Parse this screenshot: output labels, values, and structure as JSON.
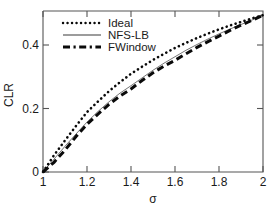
{
  "figure": {
    "background_color": "#ffffff",
    "ink_color": "#0a0a0a",
    "axis_color": "#555555"
  },
  "axes": {
    "x_label": "σ",
    "y_label": "CLR",
    "x_ticks": [
      "1",
      "1.2",
      "1.4",
      "1.6",
      "1.8",
      "2"
    ],
    "y_ticks": [
      "0",
      "0.2",
      "0.4"
    ]
  },
  "legend": {
    "entries": [
      {
        "label": "Ideal",
        "style": "dotted",
        "color": "#0a0a0a"
      },
      {
        "label": "NFS-LB",
        "style": "solid",
        "color": "#3a3a3a"
      },
      {
        "label": "FWindow",
        "style": "dash-dot",
        "color": "#0a0a0a"
      }
    ]
  },
  "chart_data": {
    "type": "line",
    "title": "",
    "xlabel": "σ",
    "ylabel": "CLR",
    "xlim": [
      1,
      2
    ],
    "ylim": [
      0,
      0.5
    ],
    "xticks": [
      1,
      1.2,
      1.4,
      1.6,
      1.8,
      2
    ],
    "yticks": [
      0,
      0.2,
      0.4
    ],
    "grid": false,
    "legend_position": "upper-left-inside",
    "x": [
      1.0,
      1.05,
      1.1,
      1.15,
      1.2,
      1.25,
      1.3,
      1.35,
      1.4,
      1.45,
      1.5,
      1.55,
      1.6,
      1.65,
      1.7,
      1.75,
      1.8,
      1.85,
      1.9,
      1.95,
      2.0
    ],
    "series": [
      {
        "name": "Ideal",
        "style": "dotted",
        "values": [
          0.0,
          0.052,
          0.098,
          0.143,
          0.186,
          0.219,
          0.251,
          0.279,
          0.305,
          0.327,
          0.348,
          0.367,
          0.385,
          0.401,
          0.416,
          0.43,
          0.443,
          0.455,
          0.466,
          0.477,
          0.487
        ]
      },
      {
        "name": "NFS-LB",
        "style": "solid",
        "values": [
          0.0,
          0.04,
          0.08,
          0.118,
          0.155,
          0.188,
          0.218,
          0.245,
          0.268,
          0.292,
          0.316,
          0.338,
          0.358,
          0.378,
          0.396,
          0.413,
          0.429,
          0.444,
          0.458,
          0.472,
          0.487
        ]
      },
      {
        "name": "FWindow",
        "style": "dash-dot",
        "values": [
          0.0,
          0.03,
          0.068,
          0.11,
          0.148,
          0.18,
          0.21,
          0.236,
          0.258,
          0.284,
          0.308,
          0.329,
          0.347,
          0.367,
          0.387,
          0.405,
          0.422,
          0.44,
          0.456,
          0.471,
          0.487
        ]
      }
    ]
  }
}
